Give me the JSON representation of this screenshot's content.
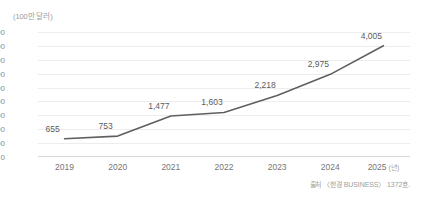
{
  "chart_data": {
    "type": "line",
    "title": "",
    "unit_caption": "(100만 달러)",
    "xlabel": "",
    "ylabel": "",
    "x_axis_suffix": "(년)",
    "categories": [
      "2019",
      "2020",
      "2021",
      "2022",
      "2023",
      "2024",
      "2025"
    ],
    "values": [
      655,
      753,
      1477,
      1603,
      2218,
      2975,
      4005
    ],
    "value_labels": [
      "655",
      "753",
      "1,477",
      "1,603",
      "2,218",
      "2,975",
      "4,005"
    ],
    "ylim": [
      0,
      4500
    ],
    "yticks": [
      0,
      500,
      1000,
      1500,
      2000,
      2500,
      3000,
      3500,
      4000,
      4500
    ],
    "ytick_labels": [
      "0",
      "500",
      "1,000",
      "1,500",
      "2,000",
      "2,500",
      "3,000",
      "3,500",
      "4,000",
      "4,500"
    ],
    "grid": true,
    "legend": "none",
    "line_color": "#5f5f5f",
    "grid_color": "#ededed",
    "axis_color": "#d8d8d8",
    "label_color": "#5c5c5c",
    "tick_color": "#8c8c8c",
    "source": "출처 〈한경 BUSINESS〉 1372호."
  }
}
